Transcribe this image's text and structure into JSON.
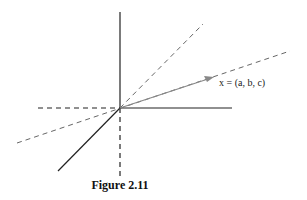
{
  "figure": {
    "caption": "Figure 2.11",
    "vector_label": "x = (a, b, c)",
    "colors": {
      "axis": "#222222",
      "dashed": "#555555",
      "vector": "#888888"
    }
  }
}
